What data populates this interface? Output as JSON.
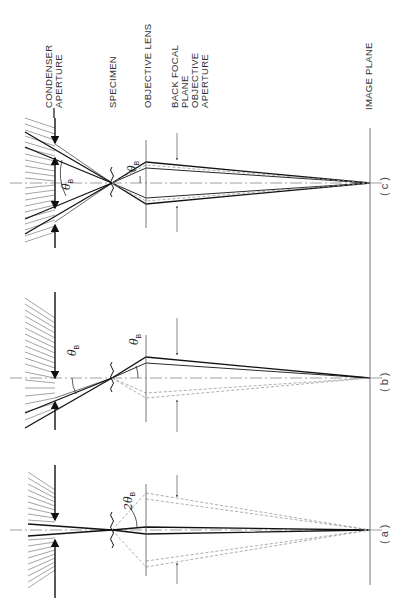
{
  "figure": {
    "orientation": "rotated 90 degrees counter-clockwise",
    "plane_labels": {
      "condenser_aperture": [
        "CONDENSER",
        "APERTURE"
      ],
      "specimen": "SPECIMEN",
      "objective_lens": "OBJECTIVE  LENS",
      "back_focal_plane": [
        "BACK  FOCAL",
        "PLANE",
        "OBJECTIVE",
        "APERTURE"
      ],
      "image_plane": "IMAGE  PLANE"
    },
    "panels": [
      {
        "id": "c",
        "label": "(c)",
        "angle_label": "θ",
        "angle_sub": "B",
        "angle_label_2": "θ",
        "angle_sub_2": "B"
      },
      {
        "id": "b",
        "label": "(b)",
        "angle_label": "θ",
        "angle_sub": "B",
        "angle_label_2": "θ",
        "angle_sub_2": "B"
      },
      {
        "id": "a",
        "label": "(a)",
        "angle_label": "2θ",
        "angle_sub": "B"
      }
    ],
    "colors": {
      "solid_ray": "#111111",
      "dashed_ray": "#8a8a8a",
      "plane_line": "#555555",
      "hatch": "#777777"
    }
  }
}
